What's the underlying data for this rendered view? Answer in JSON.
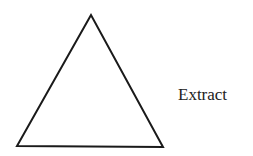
{
  "diagram": {
    "shape": "triangle",
    "vertices": [
      [
        91,
        15
      ],
      [
        17,
        146
      ],
      [
        163,
        147
      ]
    ],
    "stroke_color": "#1a1a1a",
    "fill_color": "#ffffff",
    "label": "Extract"
  }
}
